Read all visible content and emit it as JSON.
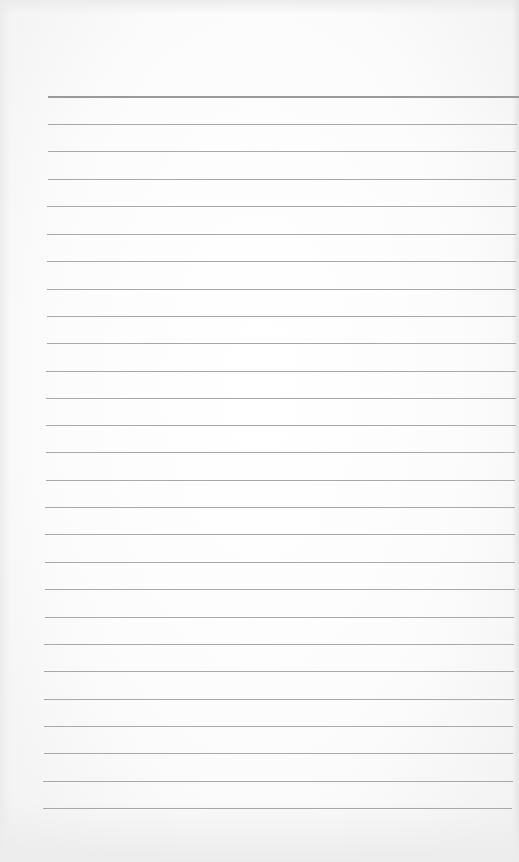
{
  "page": {
    "type": "lined-paper",
    "background_color": "#fbfbfb",
    "line_color": "#a9a9a9",
    "top_line_color": "#9a9a9a",
    "line_count": 27,
    "rules": [
      {
        "y": 96,
        "x1": 48,
        "x2": 519
      },
      {
        "y": 124,
        "x1": 48,
        "x2": 517
      },
      {
        "y": 151,
        "x1": 48,
        "x2": 516
      },
      {
        "y": 179,
        "x1": 48,
        "x2": 516
      },
      {
        "y": 206,
        "x1": 47,
        "x2": 516
      },
      {
        "y": 234,
        "x1": 47,
        "x2": 516
      },
      {
        "y": 261,
        "x1": 47,
        "x2": 516
      },
      {
        "y": 289,
        "x1": 47,
        "x2": 516
      },
      {
        "y": 316,
        "x1": 47,
        "x2": 516
      },
      {
        "y": 343,
        "x1": 47,
        "x2": 516
      },
      {
        "y": 371,
        "x1": 46,
        "x2": 516
      },
      {
        "y": 398,
        "x1": 46,
        "x2": 516
      },
      {
        "y": 425,
        "x1": 46,
        "x2": 516
      },
      {
        "y": 452,
        "x1": 46,
        "x2": 515
      },
      {
        "y": 480,
        "x1": 46,
        "x2": 515
      },
      {
        "y": 507,
        "x1": 45,
        "x2": 515
      },
      {
        "y": 534,
        "x1": 45,
        "x2": 515
      },
      {
        "y": 562,
        "x1": 45,
        "x2": 515
      },
      {
        "y": 589,
        "x1": 45,
        "x2": 515
      },
      {
        "y": 617,
        "x1": 45,
        "x2": 514
      },
      {
        "y": 644,
        "x1": 44,
        "x2": 514
      },
      {
        "y": 671,
        "x1": 44,
        "x2": 514
      },
      {
        "y": 699,
        "x1": 44,
        "x2": 514
      },
      {
        "y": 726,
        "x1": 44,
        "x2": 513
      },
      {
        "y": 753,
        "x1": 44,
        "x2": 513
      },
      {
        "y": 781,
        "x1": 43,
        "x2": 513
      },
      {
        "y": 808,
        "x1": 43,
        "x2": 512
      }
    ]
  }
}
